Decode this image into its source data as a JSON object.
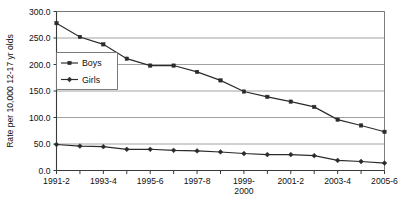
{
  "chart_data": {
    "type": "line",
    "title": "",
    "xlabel": "",
    "ylabel": "Rate per 10,000 12-17 yr olds",
    "ylim": [
      0,
      300
    ],
    "ytick_values": [
      0,
      50,
      100,
      150,
      200,
      250,
      300
    ],
    "ytick_labels": [
      "0.0",
      "50.0",
      "100.0",
      "150.0",
      "200.0",
      "250.0",
      "300.0"
    ],
    "grid": true,
    "grid_axis": "y",
    "legend_position": "upper-left-inside",
    "categories": [
      "1991-2",
      "1992-3",
      "1993-4",
      "1994-5",
      "1995-6",
      "1996-7",
      "1997-8",
      "1998-9",
      "1999-2000",
      "2000-1",
      "2001-2",
      "2002-3",
      "2003-4",
      "2004-5",
      "2005-6"
    ],
    "xtick_labels": [
      "1991-2",
      "",
      "1993-4",
      "",
      "1995-6",
      "",
      "1997-8",
      "",
      "1999-\n2000",
      "",
      "2001-2",
      "",
      "2003-4",
      "",
      "2005-6"
    ],
    "xtick_labels_visible": [
      {
        "index": 0,
        "line1": "1991-2",
        "line2": ""
      },
      {
        "index": 2,
        "line1": "1993-4",
        "line2": ""
      },
      {
        "index": 4,
        "line1": "1995-6",
        "line2": ""
      },
      {
        "index": 6,
        "line1": "1997-8",
        "line2": ""
      },
      {
        "index": 8,
        "line1": "1999-",
        "line2": "2000"
      },
      {
        "index": 10,
        "line1": "2001-2",
        "line2": ""
      },
      {
        "index": 12,
        "line1": "2003-4",
        "line2": ""
      },
      {
        "index": 14,
        "line1": "2005-6",
        "line2": ""
      }
    ],
    "series": [
      {
        "name": "Boys",
        "marker": "square",
        "color": "#2b2b2b",
        "values": [
          278,
          252,
          238,
          211,
          198,
          198,
          186,
          170,
          149,
          139,
          130,
          120,
          96,
          85,
          73
        ]
      },
      {
        "name": "Girls",
        "marker": "diamond",
        "color": "#2b2b2b",
        "values": [
          49,
          46,
          45,
          40,
          40,
          38,
          37,
          35,
          32,
          30,
          30,
          28,
          19,
          17,
          14
        ]
      }
    ]
  },
  "legend": {
    "entries": [
      {
        "label": "Boys"
      },
      {
        "label": "Girls"
      }
    ]
  },
  "colors": {
    "line": "#2b2b2b",
    "grid": "#8a8a8a",
    "axis": "#3a3a3a",
    "background": "#ffffff"
  }
}
